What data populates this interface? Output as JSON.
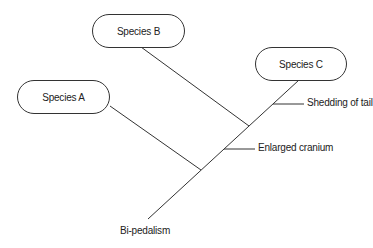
{
  "diagram": {
    "type": "cladogram",
    "taxa": [
      {
        "id": "A",
        "label": "Species A"
      },
      {
        "id": "B",
        "label": "Species B"
      },
      {
        "id": "C",
        "label": "Species C"
      }
    ],
    "traits": [
      {
        "label": "Bi-pedalism",
        "position": "root"
      },
      {
        "label": "Enlarged cranium",
        "position": "between A and B branches"
      },
      {
        "label": "Shedding of tail",
        "position": "between B and C branches"
      }
    ]
  },
  "colors": {
    "line": "#333333",
    "text": "#222222",
    "background": "#ffffff"
  }
}
